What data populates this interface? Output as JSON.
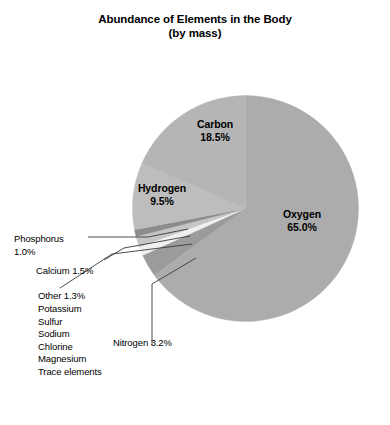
{
  "chart_data": {
    "type": "pie",
    "title": "Abundance of Elements in the Body",
    "subtitle": "(by mass)",
    "title_full": "Abundance of Elements in the Body (by mass)",
    "xlabel": "",
    "ylabel": "",
    "units": "percent by mass",
    "legend_position": "none",
    "grid": false,
    "start_angle_deg": 0,
    "direction": "clockwise",
    "categories": [
      "Oxygen",
      "Nitrogen",
      "Other",
      "Calcium",
      "Phosphorus",
      "Hydrogen",
      "Carbon"
    ],
    "values": [
      65.0,
      3.2,
      1.3,
      1.5,
      1.0,
      9.5,
      18.5
    ],
    "slices": [
      {
        "label": "Oxygen",
        "value": 65.0,
        "display": "65.0%",
        "color": "#acacac",
        "label_placement": "inside"
      },
      {
        "label": "Nitrogen",
        "value": 3.2,
        "display": "3.2%",
        "color": "#9b9b9b",
        "label_placement": "callout"
      },
      {
        "label": "Other",
        "value": 1.3,
        "display": "1.3%",
        "color": "#f0f0f0",
        "label_placement": "callout"
      },
      {
        "label": "Calcium",
        "value": 1.5,
        "display": "1.5%",
        "color": "#c6c6c6",
        "label_placement": "callout"
      },
      {
        "label": "Phosphorus",
        "value": 1.0,
        "display": "1.0%",
        "color": "#8c8c8c",
        "label_placement": "callout"
      },
      {
        "label": "Hydrogen",
        "value": 9.5,
        "display": "9.5%",
        "color": "#bdbdbd",
        "label_placement": "inside"
      },
      {
        "label": "Carbon",
        "value": 18.5,
        "display": "18.5%",
        "color": "#b5b5b5",
        "label_placement": "inside"
      }
    ],
    "annotations": {
      "other_breakdown_title": "Other 1.3%",
      "other_breakdown_items": [
        "Potassium",
        "Sulfur",
        "Sodium",
        "Chlorine",
        "Magnesium",
        "Trace elements"
      ]
    }
  },
  "labels": {
    "carbon": {
      "name": "Carbon",
      "pct": "18.5%"
    },
    "hydrogen": {
      "name": "Hydrogen",
      "pct": "9.5%"
    },
    "oxygen": {
      "name": "Oxygen",
      "pct": "65.0%"
    },
    "phosphorus": {
      "name": "Phosphorus",
      "pct": "1.0%"
    },
    "calcium_line": "Calcium 1.5%",
    "other_line": "Other 1.3%",
    "nitrogen_line": "Nitrogen 3.2%"
  },
  "other_list": {
    "items": [
      "Potassium",
      "Sulfur",
      "Sodium",
      "Chlorine",
      "Magnesium",
      "Trace elements"
    ]
  },
  "colors": {
    "background": "#ffffff",
    "text": "#000000",
    "leader_line": "#3a3a3a",
    "oxygen": "#acacac",
    "carbon": "#b5b5b5",
    "hydrogen": "#bdbdbd",
    "nitrogen": "#9b9b9b",
    "calcium": "#c6c6c6",
    "phosphorus": "#8c8c8c",
    "other": "#f0f0f0"
  }
}
